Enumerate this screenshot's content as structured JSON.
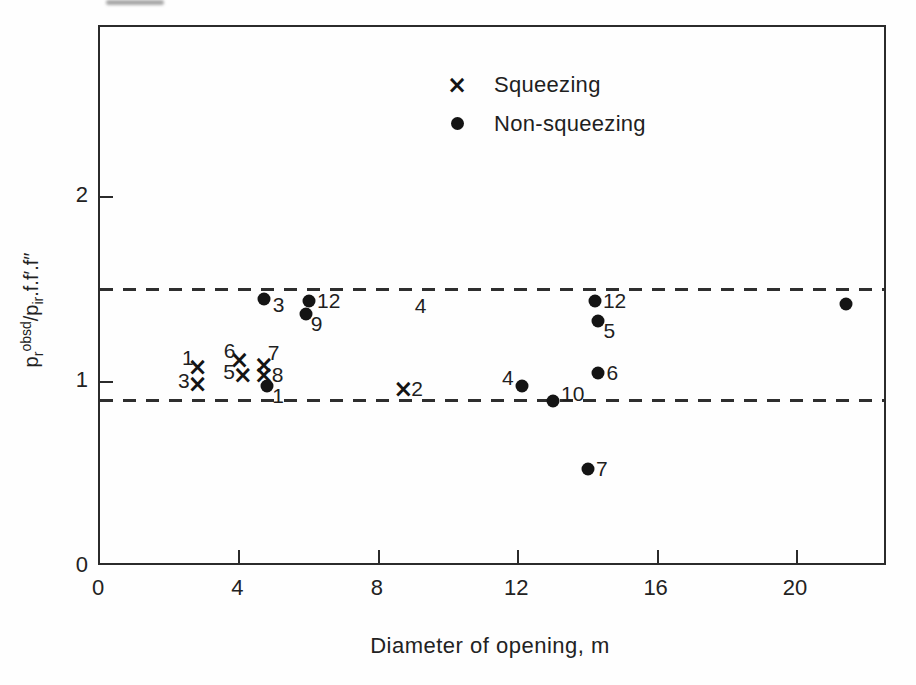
{
  "figure": {
    "xlabel": "Diameter of opening, m",
    "ylabel_text": "p_r^obsd / p_ir.f.f′.f″",
    "ylabel_parts": {
      "base1": "p",
      "sub1": "r",
      "sup1": "obsd",
      "base2": "/p",
      "sub2": "ir",
      "rest": ".f.f′.f″"
    },
    "legend": {
      "squeezing_label": "Squeezing",
      "non_squeezing_label": "Non-squeezing",
      "squeezing_marker": "×",
      "non_squeezing_marker": "dot"
    },
    "colors": {
      "ink": "#141414",
      "line": "#2b2b2b",
      "background": "#fefefe"
    }
  },
  "chart_data": {
    "type": "scatter",
    "title": "",
    "xlabel": "Diameter of opening, m",
    "ylabel": "p_r^obsd / p_ir.f.f'.f''",
    "xlim": [
      0,
      22.61
    ],
    "ylim": [
      0,
      2.92
    ],
    "x_ticks": [
      0,
      4,
      8,
      12,
      16,
      20
    ],
    "y_ticks": [
      0,
      1,
      2
    ],
    "grid": false,
    "legend_position": "upper-center",
    "reference_lines": [
      {
        "y": 1.5,
        "style": "dashed"
      },
      {
        "y": 0.9,
        "style": "dashed"
      }
    ],
    "series": [
      {
        "name": "Squeezing",
        "marker": "x",
        "points": [
          {
            "x": 2.8,
            "y": 1.08,
            "label": "1",
            "label_pos": "above-left"
          },
          {
            "x": 2.8,
            "y": 0.99,
            "label": "3",
            "label_pos": "left"
          },
          {
            "x": 4.0,
            "y": 1.12,
            "label": "6",
            "label_pos": "above-left"
          },
          {
            "x": 4.1,
            "y": 1.04,
            "label": "5",
            "label_pos": "left"
          },
          {
            "x": 4.7,
            "y": 1.09,
            "label": "7",
            "label_pos": "above-right"
          },
          {
            "x": 4.7,
            "y": 1.04,
            "label": "8",
            "label_pos": "right"
          },
          {
            "x": 8.7,
            "y": 0.96,
            "label": "2",
            "label_pos": "right"
          },
          {
            "x": 9.2,
            "y": 1.5,
            "label": "4",
            "label_pos": "below",
            "marker_hidden": true
          }
        ]
      },
      {
        "name": "Non-squeezing",
        "marker": "dot",
        "points": [
          {
            "x": 4.7,
            "y": 1.45,
            "label": "3",
            "label_pos": "right-below"
          },
          {
            "x": 4.8,
            "y": 0.98,
            "label": "1",
            "label_pos": "below-right"
          },
          {
            "x": 6.0,
            "y": 1.44,
            "label": "12",
            "label_pos": "right"
          },
          {
            "x": 5.9,
            "y": 1.37,
            "label": "9",
            "label_pos": "below-right"
          },
          {
            "x": 12.1,
            "y": 0.98,
            "label": "4",
            "label_pos": "left-above"
          },
          {
            "x": 13.0,
            "y": 0.9,
            "label": "10",
            "label_pos": "right-above"
          },
          {
            "x": 14.2,
            "y": 1.44,
            "label": "12",
            "label_pos": "right"
          },
          {
            "x": 14.3,
            "y": 1.33,
            "label": "5",
            "label_pos": "below-right"
          },
          {
            "x": 14.3,
            "y": 1.05,
            "label": "6",
            "label_pos": "right"
          },
          {
            "x": 14.0,
            "y": 0.53,
            "label": "7",
            "label_pos": "right"
          },
          {
            "x": 21.4,
            "y": 1.42,
            "label": "",
            "label_pos": "none"
          }
        ]
      }
    ]
  }
}
